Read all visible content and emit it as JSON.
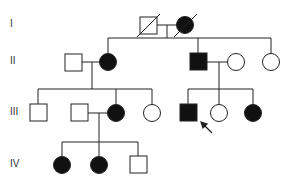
{
  "colors": {
    "line": "#222222",
    "affected": "#111111",
    "unaffected": "#ffffff"
  },
  "generations": [
    {
      "label": "I",
      "y": 25
    },
    {
      "label": "II",
      "y": 62
    },
    {
      "label": "III",
      "y": 113
    },
    {
      "label": "IV",
      "y": 165
    }
  ],
  "individuals": [
    {
      "id": "I-1",
      "generation": "I",
      "sex": "male",
      "affected": false,
      "deceased": true,
      "x": 148,
      "y": 25
    },
    {
      "id": "I-2",
      "generation": "I",
      "sex": "female",
      "affected": true,
      "deceased": true,
      "x": 185,
      "y": 25
    },
    {
      "id": "II-1",
      "generation": "II",
      "sex": "male",
      "affected": false,
      "deceased": false,
      "x": 73,
      "y": 62
    },
    {
      "id": "II-2",
      "generation": "II",
      "sex": "female",
      "affected": true,
      "deceased": false,
      "x": 108,
      "y": 62
    },
    {
      "id": "II-3",
      "generation": "II",
      "sex": "male",
      "affected": true,
      "deceased": false,
      "x": 198,
      "y": 62
    },
    {
      "id": "II-4",
      "generation": "II",
      "sex": "female",
      "affected": false,
      "deceased": false,
      "x": 236,
      "y": 62
    },
    {
      "id": "II-5",
      "generation": "II",
      "sex": "female",
      "affected": false,
      "deceased": false,
      "x": 271,
      "y": 62
    },
    {
      "id": "III-1",
      "generation": "III",
      "sex": "male",
      "affected": false,
      "deceased": false,
      "x": 38,
      "y": 113
    },
    {
      "id": "III-2",
      "generation": "III",
      "sex": "male",
      "affected": false,
      "deceased": false,
      "x": 79,
      "y": 113
    },
    {
      "id": "III-3",
      "generation": "III",
      "sex": "female",
      "affected": true,
      "deceased": false,
      "x": 116,
      "y": 113
    },
    {
      "id": "III-4",
      "generation": "III",
      "sex": "female",
      "affected": false,
      "deceased": false,
      "x": 152,
      "y": 113
    },
    {
      "id": "III-5",
      "generation": "III",
      "sex": "male",
      "affected": true,
      "deceased": false,
      "proband": true,
      "x": 188,
      "y": 113
    },
    {
      "id": "III-6",
      "generation": "III",
      "sex": "female",
      "affected": false,
      "deceased": false,
      "x": 219,
      "y": 113
    },
    {
      "id": "III-7",
      "generation": "III",
      "sex": "female",
      "affected": true,
      "deceased": false,
      "x": 253,
      "y": 113
    },
    {
      "id": "IV-1",
      "generation": "IV",
      "sex": "female",
      "affected": true,
      "deceased": false,
      "x": 62,
      "y": 165
    },
    {
      "id": "IV-2",
      "generation": "IV",
      "sex": "female",
      "affected": true,
      "deceased": false,
      "x": 99,
      "y": 165
    },
    {
      "id": "IV-3",
      "generation": "IV",
      "sex": "male",
      "affected": false,
      "deceased": false,
      "x": 138,
      "y": 165
    }
  ],
  "legend": {
    "proband_marker": "arrow"
  }
}
